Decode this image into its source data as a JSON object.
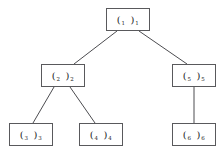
{
  "diagram": {
    "background_color": "#ffffff",
    "node_border_color": "#59595c",
    "edge_color": "#4c4c50",
    "text_color": "#1b1b1e",
    "nodes": [
      {
        "id": "n1",
        "open": "(",
        "close": ")",
        "index": "1",
        "x": 106,
        "y": 8,
        "w": 44,
        "h": 23
      },
      {
        "id": "n2",
        "open": "(",
        "close": ")",
        "index": "2",
        "x": 41,
        "y": 64,
        "w": 44,
        "h": 23
      },
      {
        "id": "n5",
        "open": "(",
        "close": ")",
        "index": "5",
        "x": 172,
        "y": 64,
        "w": 44,
        "h": 23
      },
      {
        "id": "n3",
        "open": "(",
        "close": ")",
        "index": "3",
        "x": 9,
        "y": 123,
        "w": 44,
        "h": 23
      },
      {
        "id": "n4",
        "open": "(",
        "close": ")",
        "index": "4",
        "x": 79,
        "y": 123,
        "w": 44,
        "h": 23
      },
      {
        "id": "n6",
        "open": "(",
        "close": ")",
        "index": "6",
        "x": 172,
        "y": 123,
        "w": 44,
        "h": 23
      }
    ],
    "edges": [
      {
        "id": "e1",
        "from": "n1",
        "to": "n2",
        "x1": 117,
        "y1": 31,
        "x2": 74,
        "y2": 64
      },
      {
        "id": "e2",
        "from": "n1",
        "to": "n5",
        "x1": 139,
        "y1": 31,
        "x2": 187,
        "y2": 64
      },
      {
        "id": "e3",
        "from": "n2",
        "to": "n3",
        "x1": 54,
        "y1": 87,
        "x2": 33,
        "y2": 123
      },
      {
        "id": "e4",
        "from": "n2",
        "to": "n4",
        "x1": 70,
        "y1": 87,
        "x2": 95,
        "y2": 123
      },
      {
        "id": "e5",
        "from": "n5",
        "to": "n6",
        "x1": 194,
        "y1": 87,
        "x2": 194,
        "y2": 123
      }
    ]
  }
}
